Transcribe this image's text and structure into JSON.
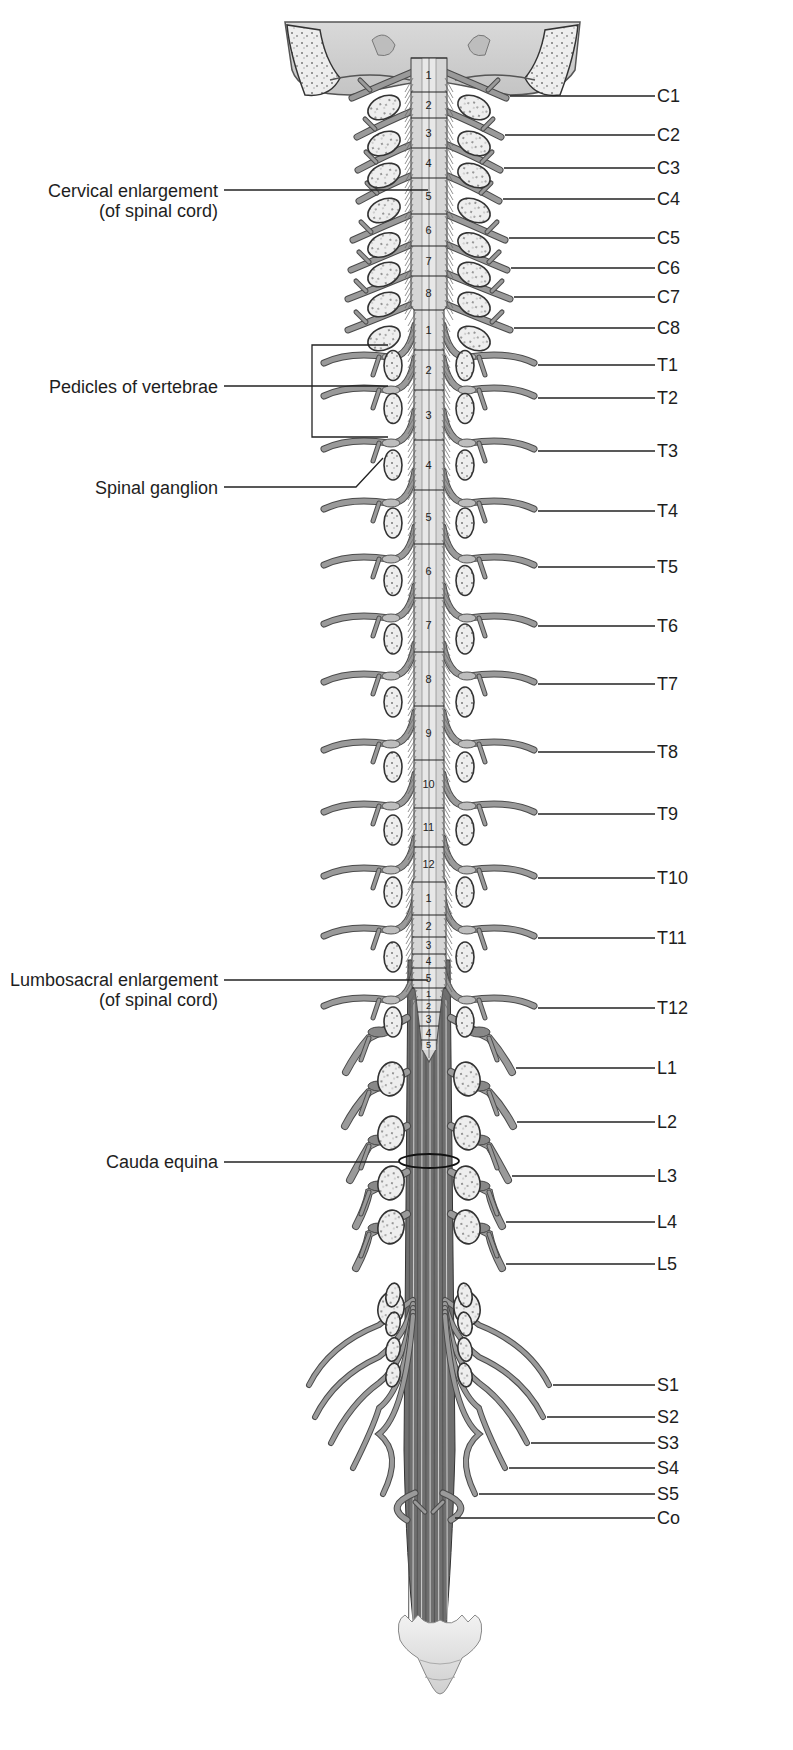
{
  "colors": {
    "background": "#ffffff",
    "nerve_fill": "#9a9a9a",
    "nerve_stroke": "#4a4a4a",
    "cord_fill": "#d6d6d6",
    "cord_center": "#e8e8e8",
    "bone_fill": "#ececec",
    "bone_stroke": "#333333",
    "label_text": "#1e1e1e",
    "leader_line": "#222222",
    "cauda_fill": "#6f6f6f"
  },
  "left_labels": [
    {
      "id": "cervical-enlargement",
      "line1": "Cervical enlargement",
      "line2": "(of spinal cord)",
      "y": 190,
      "target_x": 428
    },
    {
      "id": "pedicles-of-vertebrae",
      "line1": "Pedicles of vertebrae",
      "line2": "",
      "y": 386,
      "target_x": 312
    },
    {
      "id": "spinal-ganglion",
      "line1": "Spinal ganglion",
      "line2": "",
      "y": 487,
      "target_x": 356
    },
    {
      "id": "lumbosacral-enlargement",
      "line1": "Lumbosacral enlargement",
      "line2": "(of spinal cord)",
      "y": 980,
      "target_x": 428
    },
    {
      "id": "cauda-equina",
      "line1": "Cauda equina",
      "line2": "",
      "y": 1162,
      "target_x": 400
    }
  ],
  "nerve_labels": [
    {
      "name": "C1",
      "y": 96,
      "line_start": 510
    },
    {
      "name": "C2",
      "y": 135,
      "line_start": 505
    },
    {
      "name": "C3",
      "y": 168,
      "line_start": 504
    },
    {
      "name": "C4",
      "y": 199,
      "line_start": 503
    },
    {
      "name": "C5",
      "y": 238,
      "line_start": 509
    },
    {
      "name": "C6",
      "y": 268,
      "line_start": 511
    },
    {
      "name": "C7",
      "y": 297,
      "line_start": 514
    },
    {
      "name": "C8",
      "y": 328,
      "line_start": 514
    },
    {
      "name": "T1",
      "y": 365,
      "line_start": 538
    },
    {
      "name": "T2",
      "y": 398,
      "line_start": 538
    },
    {
      "name": "T3",
      "y": 451,
      "line_start": 538
    },
    {
      "name": "T4",
      "y": 511,
      "line_start": 538
    },
    {
      "name": "T5",
      "y": 567,
      "line_start": 538
    },
    {
      "name": "T6",
      "y": 626,
      "line_start": 538
    },
    {
      "name": "T7",
      "y": 684,
      "line_start": 538
    },
    {
      "name": "T8",
      "y": 752,
      "line_start": 538
    },
    {
      "name": "T9",
      "y": 814,
      "line_start": 538
    },
    {
      "name": "T10",
      "y": 878,
      "line_start": 538
    },
    {
      "name": "T11",
      "y": 938,
      "line_start": 538
    },
    {
      "name": "T12",
      "y": 1008,
      "line_start": 538
    },
    {
      "name": "L1",
      "y": 1068,
      "line_start": 516
    },
    {
      "name": "L2",
      "y": 1122,
      "line_start": 517
    },
    {
      "name": "L3",
      "y": 1176,
      "line_start": 512
    },
    {
      "name": "L4",
      "y": 1222,
      "line_start": 506
    },
    {
      "name": "L5",
      "y": 1264,
      "line_start": 506
    },
    {
      "name": "S1",
      "y": 1385,
      "line_start": 553
    },
    {
      "name": "S2",
      "y": 1417,
      "line_start": 547
    },
    {
      "name": "S3",
      "y": 1443,
      "line_start": 531
    },
    {
      "name": "S4",
      "y": 1468,
      "line_start": 509
    },
    {
      "name": "S5",
      "y": 1494,
      "line_start": 479
    },
    {
      "name": "Co",
      "y": 1518,
      "line_start": 455
    }
  ],
  "label_right_x": 655,
  "label_right_text_x": 657,
  "cord_segments": [
    {
      "num": "1",
      "region": "cervical",
      "top": 58,
      "bottom": 92
    },
    {
      "num": "2",
      "region": "cervical",
      "top": 92,
      "bottom": 118
    },
    {
      "num": "3",
      "region": "cervical",
      "top": 118,
      "bottom": 148
    },
    {
      "num": "4",
      "region": "cervical",
      "top": 148,
      "bottom": 178
    },
    {
      "num": "5",
      "region": "cervical",
      "top": 178,
      "bottom": 214
    },
    {
      "num": "6",
      "region": "cervical",
      "top": 214,
      "bottom": 246
    },
    {
      "num": "7",
      "region": "cervical",
      "top": 246,
      "bottom": 276
    },
    {
      "num": "8",
      "region": "cervical",
      "top": 276,
      "bottom": 310
    },
    {
      "num": "1",
      "region": "thoracic",
      "top": 310,
      "bottom": 350
    },
    {
      "num": "2",
      "region": "thoracic",
      "top": 350,
      "bottom": 390
    },
    {
      "num": "3",
      "region": "thoracic",
      "top": 390,
      "bottom": 440
    },
    {
      "num": "4",
      "region": "thoracic",
      "top": 440,
      "bottom": 490
    },
    {
      "num": "5",
      "region": "thoracic",
      "top": 490,
      "bottom": 544
    },
    {
      "num": "6",
      "region": "thoracic",
      "top": 544,
      "bottom": 598
    },
    {
      "num": "7",
      "region": "thoracic",
      "top": 598,
      "bottom": 652
    },
    {
      "num": "8",
      "region": "thoracic",
      "top": 652,
      "bottom": 706
    },
    {
      "num": "9",
      "region": "thoracic",
      "top": 706,
      "bottom": 760
    },
    {
      "num": "10",
      "region": "thoracic",
      "top": 760,
      "bottom": 808
    },
    {
      "num": "11",
      "region": "thoracic",
      "top": 808,
      "bottom": 847
    },
    {
      "num": "12",
      "region": "thoracic",
      "top": 847,
      "bottom": 882
    },
    {
      "num": "1",
      "region": "lumbar",
      "top": 882,
      "bottom": 915
    },
    {
      "num": "2",
      "region": "lumbar",
      "top": 915,
      "bottom": 937
    },
    {
      "num": "3",
      "region": "lumbar",
      "top": 937,
      "bottom": 954
    },
    {
      "num": "4",
      "region": "lumbar",
      "top": 954,
      "bottom": 968
    },
    {
      "num": "5",
      "region": "lumbar",
      "top": 968,
      "bottom": 988
    },
    {
      "num": "1",
      "region": "sacral",
      "top": 988,
      "bottom": 1000
    },
    {
      "num": "2",
      "region": "sacral",
      "top": 1000,
      "bottom": 1012
    },
    {
      "num": "3",
      "region": "sacral",
      "top": 1012,
      "bottom": 1026
    },
    {
      "num": "4",
      "region": "sacral",
      "top": 1026,
      "bottom": 1040
    },
    {
      "num": "5",
      "region": "sacral",
      "top": 1040,
      "bottom": 1050
    }
  ]
}
